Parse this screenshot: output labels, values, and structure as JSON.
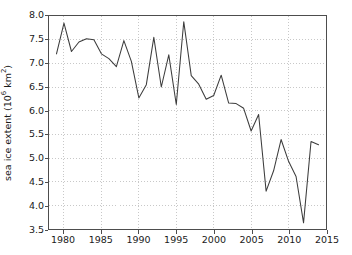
{
  "chart_data": {
    "type": "line",
    "title": "",
    "xlabel": "",
    "ylabel": "sea ice extent (10^6 km^2)",
    "ylabel_parts": {
      "text": "sea ice extent (10",
      "exp1": "6",
      "mid": " km",
      "exp2": "2",
      "close": ")"
    },
    "xlim": [
      1978,
      2015
    ],
    "ylim": [
      3.5,
      8.0
    ],
    "grid": true,
    "legend": null,
    "xticks": [
      1980,
      1985,
      1990,
      1995,
      2000,
      2005,
      2010,
      2015
    ],
    "yticks": [
      "3.5",
      "4.0",
      "4.5",
      "5.0",
      "5.5",
      "6.0",
      "6.5",
      "7.0",
      "7.5",
      "8.0"
    ],
    "ytick_values": [
      3.5,
      4.0,
      4.5,
      5.0,
      5.5,
      6.0,
      6.5,
      7.0,
      7.5,
      8.0
    ],
    "series": [
      {
        "name": "sea ice extent",
        "color": "#3c3c3c",
        "x": [
          1979,
          1980,
          1981,
          1982,
          1983,
          1984,
          1985,
          1986,
          1987,
          1988,
          1989,
          1990,
          1991,
          1992,
          1993,
          1994,
          1995,
          1996,
          1997,
          1998,
          1999,
          2000,
          2001,
          2002,
          2003,
          2004,
          2005,
          2006,
          2007,
          2008,
          2009,
          2010,
          2011,
          2012,
          2013,
          2014
        ],
        "values": [
          7.2,
          7.85,
          7.25,
          7.45,
          7.52,
          7.5,
          7.2,
          7.1,
          6.93,
          7.48,
          7.04,
          6.27,
          6.55,
          7.55,
          6.5,
          7.18,
          6.13,
          7.88,
          6.74,
          6.56,
          6.24,
          6.32,
          6.75,
          6.16,
          6.15,
          6.05,
          5.57,
          5.92,
          4.3,
          4.73,
          5.39,
          4.93,
          4.61,
          3.63,
          5.35,
          5.28
        ]
      }
    ]
  }
}
